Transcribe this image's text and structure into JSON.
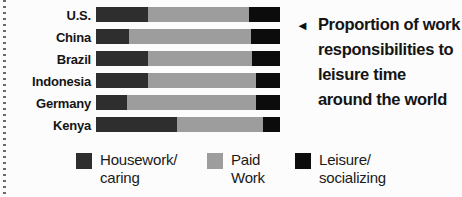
{
  "chart_data": {
    "type": "bar",
    "orientation": "horizontal",
    "stacked": true,
    "title": "Proportion of work responsibilities to leisure time around the world",
    "xlabel": "",
    "ylabel": "",
    "xlim": [
      0,
      100
    ],
    "grid": false,
    "legend_position": "bottom",
    "categories": [
      "U.S.",
      "China",
      "Brazil",
      "Indonesia",
      "Germany",
      "Kenya"
    ],
    "series": [
      {
        "key": "housework-caring",
        "name": "Housework/caring",
        "color": "#2e2e2e",
        "values": [
          28,
          18,
          28,
          28,
          17,
          44
        ]
      },
      {
        "key": "paid-work",
        "name": "Paid Work",
        "color": "#9d9d9d",
        "values": [
          55,
          66,
          57,
          59,
          70,
          47
        ]
      },
      {
        "key": "leisure-socializing",
        "name": "Leisure/socializing",
        "color": "#0c0c0c",
        "values": [
          17,
          16,
          15,
          13,
          13,
          9
        ]
      }
    ]
  },
  "annotation": {
    "arrow": "◄",
    "lines": [
      "Proportion of work",
      "responsibilities to",
      "leisure time",
      "around the world"
    ]
  },
  "legend": {
    "items": [
      {
        "color": "#2e2e2e",
        "lines": [
          "Housework/",
          "caring"
        ]
      },
      {
        "color": "#9d9d9d",
        "lines": [
          "Paid",
          "Work"
        ]
      },
      {
        "color": "#0c0c0c",
        "lines": [
          "Leisure/",
          "socializing"
        ]
      }
    ]
  },
  "colors": {
    "background": "#fcfcfc",
    "dotted_divider": "#6a6a6a",
    "text": "#141414"
  }
}
